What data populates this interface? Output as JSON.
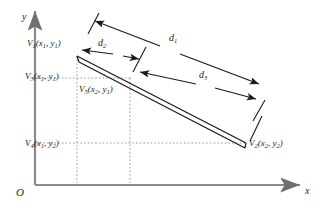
{
  "diagram": {
    "axes": {
      "x_label": "x",
      "y_label": "y",
      "origin_label": "O",
      "axis_color": "#8a8a8a"
    },
    "vertices": [
      {
        "id": "v1",
        "name": "V",
        "sub": "1",
        "x_var": "x",
        "x_sub": "1",
        "y_var": "y",
        "y_sub": "1",
        "label": "V1(x1, y1)"
      },
      {
        "id": "v2",
        "name": "V",
        "sub": "2",
        "x_var": "x",
        "x_sub": "2",
        "y_var": "y",
        "y_sub": "2",
        "label": "V2(x2, y2)"
      },
      {
        "id": "v3",
        "name": "V",
        "sub": "3",
        "x_var": "x",
        "x_sub": "1",
        "y_var": "y",
        "y_sub": "1",
        "label": "V3(x1, y1)"
      },
      {
        "id": "v4",
        "name": "V",
        "sub": "4",
        "x_var": "x",
        "x_sub": "1",
        "y_var": "y",
        "y_sub": "2",
        "label": "V4(x1, y2)"
      },
      {
        "id": "v5",
        "name": "V",
        "sub": "5",
        "x_var": "x",
        "x_sub": "2",
        "y_var": "y",
        "y_sub": "1",
        "label": "V5(x2, y1)"
      }
    ],
    "distances": [
      {
        "id": "d1",
        "name": "d",
        "sub": "1"
      },
      {
        "id": "d2",
        "name": "d",
        "sub": "2"
      },
      {
        "id": "d3",
        "name": "d",
        "sub": "3"
      }
    ],
    "line_color": "#1a1a1a",
    "dotted_color": "#9a9a9a"
  }
}
